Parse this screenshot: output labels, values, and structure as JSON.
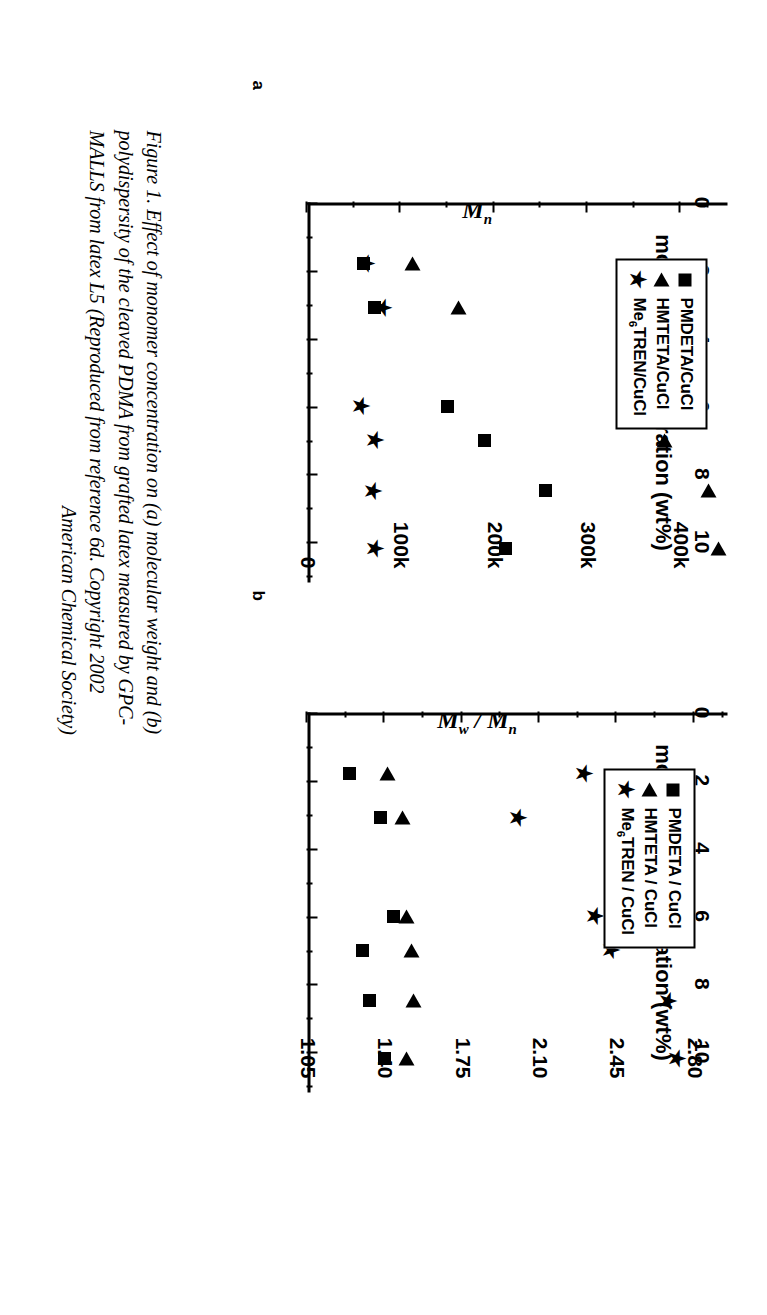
{
  "figure": {
    "caption_lines": [
      "Figure 1. Effect of monomer concentration on (a) molecular weight  and (b)",
      "polydispersity of the cleaved PDMA from grafted latex measured by GPC-",
      "MALLS from latex L5 (Reproduced from reference 6d.  Copyright 2002",
      "American Chemical Society)"
    ],
    "panel_a_letter": "a",
    "panel_b_letter": "b"
  },
  "chart_data": [
    {
      "type": "scatter",
      "panel": "a",
      "title": "",
      "xlabel": "monomer concentration (wt%)",
      "ylabel": "M_n",
      "ylabel_display": "Mn",
      "xlim": [
        0,
        11.2
      ],
      "ylim": [
        0,
        450000
      ],
      "xticks": [
        0,
        2,
        4,
        6,
        8,
        10
      ],
      "xtick_labels": [
        "0",
        "2",
        "4",
        "6",
        "8",
        "10"
      ],
      "xminor_ticks": [
        1,
        3,
        5,
        7,
        9,
        11
      ],
      "yticks": [
        0,
        100000,
        200000,
        300000,
        400000
      ],
      "ytick_labels": [
        "0",
        "100k",
        "200k",
        "300k",
        "400k"
      ],
      "yminor_ticks": [
        50000,
        150000,
        250000,
        350000,
        430000
      ],
      "grid": false,
      "legend_position": "upper-left",
      "series": [
        {
          "name": "PMDETA/CuCl",
          "marker": "square",
          "points": [
            {
              "x": 1.8,
              "y": 60000
            },
            {
              "x": 3.1,
              "y": 72000
            },
            {
              "x": 6.0,
              "y": 150000
            },
            {
              "x": 7.0,
              "y": 190000
            },
            {
              "x": 8.5,
              "y": 255000
            },
            {
              "x": 10.2,
              "y": 212000
            }
          ]
        },
        {
          "name": "HMTETA/CuCl",
          "marker": "triangle",
          "points": [
            {
              "x": 1.8,
              "y": 113000
            },
            {
              "x": 3.1,
              "y": 162000
            },
            {
              "x": 6.0,
              "y": 365000
            },
            {
              "x": 7.0,
              "y": 382000
            },
            {
              "x": 8.5,
              "y": 430000
            },
            {
              "x": 10.2,
              "y": 440000
            }
          ]
        },
        {
          "name": "Me6TREN/CuCl",
          "marker": "star",
          "points": [
            {
              "x": 1.8,
              "y": 62000
            },
            {
              "x": 3.1,
              "y": 80000
            },
            {
              "x": 6.0,
              "y": 57000
            },
            {
              "x": 7.0,
              "y": 72000
            },
            {
              "x": 8.5,
              "y": 70000
            },
            {
              "x": 10.2,
              "y": 72000
            }
          ]
        }
      ]
    },
    {
      "type": "scatter",
      "panel": "b",
      "title": "",
      "xlabel": "monomer concentration (wt%)",
      "ylabel": "M_w / M_n",
      "ylabel_display": "Mw / Mn",
      "xlim": [
        0,
        11.2
      ],
      "ylim": [
        1.05,
        2.95
      ],
      "xticks": [
        0,
        2,
        4,
        6,
        8,
        10
      ],
      "xtick_labels": [
        "0",
        "2",
        "4",
        "6",
        "8",
        "10"
      ],
      "xminor_ticks": [
        1,
        3,
        5,
        7,
        9,
        11
      ],
      "yticks": [
        1.05,
        1.4,
        1.75,
        2.1,
        2.45,
        2.8
      ],
      "ytick_labels": [
        "1.05",
        "1.40",
        "1.75",
        "2.10",
        "2.45",
        "2.80"
      ],
      "yminor_ticks": [
        1.225,
        1.575,
        1.925,
        2.275,
        2.625,
        2.93
      ],
      "grid": false,
      "legend_position": "upper-left",
      "series": [
        {
          "name": "PMDETA / CuCl",
          "marker": "square",
          "points": [
            {
              "x": 1.8,
              "y": 1.24
            },
            {
              "x": 3.1,
              "y": 1.38
            },
            {
              "x": 6.0,
              "y": 1.44
            },
            {
              "x": 7.0,
              "y": 1.3
            },
            {
              "x": 8.5,
              "y": 1.33
            },
            {
              "x": 10.2,
              "y": 1.4
            }
          ]
        },
        {
          "name": "HMTETA / CuCl",
          "marker": "triangle",
          "points": [
            {
              "x": 1.8,
              "y": 1.41
            },
            {
              "x": 3.1,
              "y": 1.48
            },
            {
              "x": 6.0,
              "y": 1.5
            },
            {
              "x": 7.0,
              "y": 1.52
            },
            {
              "x": 8.5,
              "y": 1.53
            },
            {
              "x": 10.2,
              "y": 1.5
            }
          ]
        },
        {
          "name": "Me6TREN / CuCl",
          "marker": "star",
          "points": [
            {
              "x": 1.8,
              "y": 2.3
            },
            {
              "x": 3.1,
              "y": 2.0
            },
            {
              "x": 6.0,
              "y": 2.35
            },
            {
              "x": 7.0,
              "y": 2.42
            },
            {
              "x": 8.5,
              "y": 2.68
            },
            {
              "x": 10.2,
              "y": 2.72
            }
          ]
        }
      ]
    }
  ]
}
